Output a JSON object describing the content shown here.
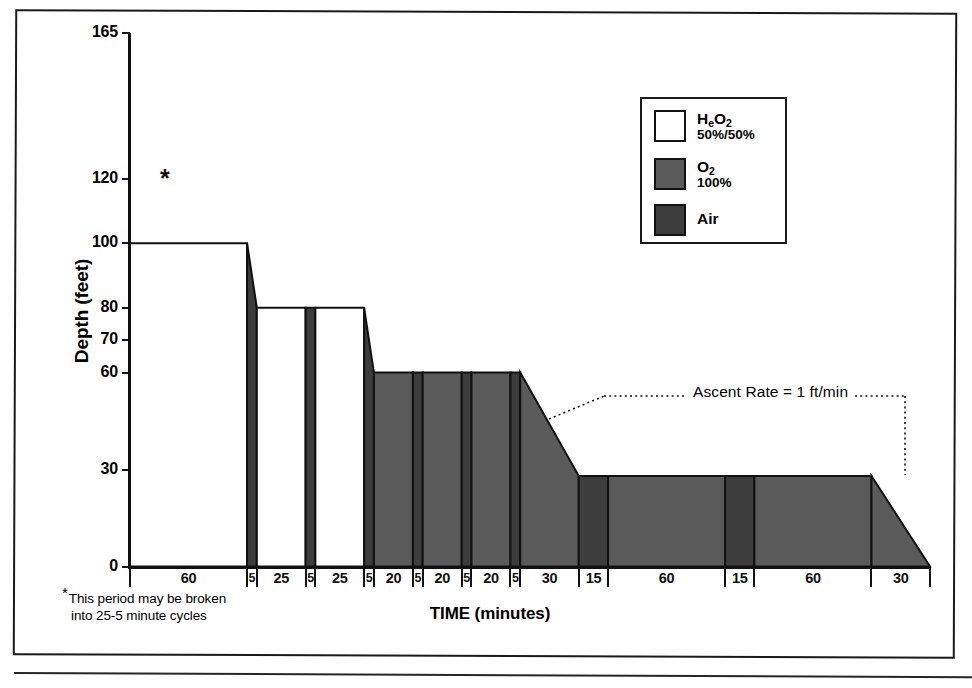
{
  "figure": {
    "y_axis_title": "Depth (feet)",
    "x_axis_title": "TIME (minutes)",
    "plateau_marker": "*",
    "footnote_marker": "*",
    "footnote_line1": "This period may be broken",
    "footnote_line2": "into 25-5 minute cycles",
    "ascent_note": "Ascent Rate = 1 ft/min"
  },
  "legend": {
    "items": [
      {
        "label": "H",
        "sub": "e",
        "label2": "O",
        "sub2": "2",
        "full_label": "HeO2",
        "sublabel": "50%/50%",
        "color": "#ffffff"
      },
      {
        "label": "O",
        "sub": "",
        "label2": "",
        "sub2": "2",
        "full_label": "O2",
        "sublabel": "100%",
        "color": "#5a5a5a"
      },
      {
        "label": "Air",
        "sub": "",
        "label2": "",
        "sub2": "",
        "full_label": "Air",
        "sublabel": "",
        "color": "#3d3d3d"
      }
    ]
  },
  "colors": {
    "heo2": "#ffffff",
    "o2": "#5a5a5a",
    "air": "#3d3d3d",
    "outline": "#111111",
    "frame": "#1a1a1a"
  },
  "chart_data": {
    "type": "area",
    "xlabel": "TIME (minutes)",
    "ylabel": "Depth (feet)",
    "ylim": [
      0,
      165
    ],
    "yticks": [
      0,
      30,
      60,
      70,
      80,
      100,
      120,
      165
    ],
    "ytick_labels": [
      "0",
      "30",
      "60",
      "70",
      "80",
      "100",
      "120",
      "165"
    ],
    "grid": false,
    "legend_position": "upper-right",
    "x_total_minutes": 415,
    "segment_durations": [
      60,
      5,
      25,
      5,
      25,
      5,
      20,
      5,
      20,
      5,
      20,
      5,
      30,
      15,
      60,
      15,
      60,
      30
    ],
    "segment_labels": [
      "60",
      "5",
      "25",
      "5",
      "25",
      "5",
      "20",
      "5",
      "20",
      "5",
      "20",
      "5",
      "30",
      "15",
      "60",
      "15",
      "60",
      "30"
    ],
    "segments": [
      {
        "label": "60",
        "minutes": 60,
        "gas": "HeO2",
        "depth_start": 100,
        "depth_end": 100
      },
      {
        "label": "5",
        "minutes": 5,
        "gas": "Air",
        "depth_start": 100,
        "depth_end": 80
      },
      {
        "label": "25",
        "minutes": 25,
        "gas": "HeO2",
        "depth_start": 80,
        "depth_end": 80
      },
      {
        "label": "5",
        "minutes": 5,
        "gas": "Air",
        "depth_start": 80,
        "depth_end": 80
      },
      {
        "label": "25",
        "minutes": 25,
        "gas": "HeO2",
        "depth_start": 80,
        "depth_end": 80
      },
      {
        "label": "5",
        "minutes": 5,
        "gas": "Air",
        "depth_start": 80,
        "depth_end": 60
      },
      {
        "label": "20",
        "minutes": 20,
        "gas": "O2",
        "depth_start": 60,
        "depth_end": 60
      },
      {
        "label": "5",
        "minutes": 5,
        "gas": "Air",
        "depth_start": 60,
        "depth_end": 60
      },
      {
        "label": "20",
        "minutes": 20,
        "gas": "O2",
        "depth_start": 60,
        "depth_end": 60
      },
      {
        "label": "5",
        "minutes": 5,
        "gas": "Air",
        "depth_start": 60,
        "depth_end": 60
      },
      {
        "label": "20",
        "minutes": 20,
        "gas": "O2",
        "depth_start": 60,
        "depth_end": 60
      },
      {
        "label": "5",
        "minutes": 5,
        "gas": "Air",
        "depth_start": 60,
        "depth_end": 60
      },
      {
        "label": "30",
        "minutes": 30,
        "gas": "O2",
        "depth_start": 60,
        "depth_end": 28
      },
      {
        "label": "15",
        "minutes": 15,
        "gas": "Air",
        "depth_start": 28,
        "depth_end": 28
      },
      {
        "label": "60",
        "minutes": 60,
        "gas": "O2",
        "depth_start": 28,
        "depth_end": 28
      },
      {
        "label": "15",
        "minutes": 15,
        "gas": "Air",
        "depth_start": 28,
        "depth_end": 28
      },
      {
        "label": "60",
        "minutes": 60,
        "gas": "O2",
        "depth_start": 28,
        "depth_end": 28
      },
      {
        "label": "30",
        "minutes": 30,
        "gas": "O2",
        "depth_start": 28,
        "depth_end": 0
      }
    ],
    "annotations": [
      {
        "text": "Ascent Rate = 1 ft/min",
        "kind": "leader-line"
      },
      {
        "text": "* This period may be broken into 25-5 minute cycles",
        "kind": "footnote"
      }
    ]
  }
}
